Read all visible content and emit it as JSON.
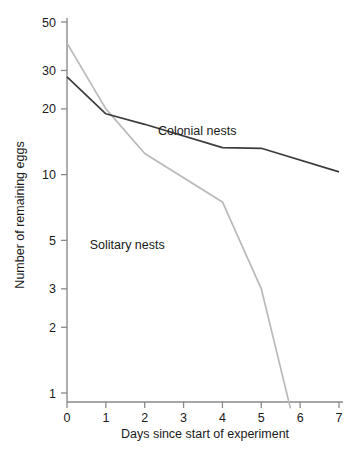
{
  "chart_data": {
    "type": "line",
    "title": "",
    "xlabel": "Days since start of experiment",
    "ylabel": "Number of remaining eggs",
    "yscale": "log",
    "ylim": [
      0.85,
      50
    ],
    "xlim": [
      0,
      7
    ],
    "grid": false,
    "legend_position": "inline-annotation",
    "yticks": [
      1,
      2,
      3,
      5,
      10,
      20,
      30,
      50
    ],
    "ytick_labels": [
      "1",
      "2",
      "3",
      "5",
      "10",
      "20",
      "30",
      "50"
    ],
    "xticks": [
      0,
      1,
      2,
      3,
      4,
      5,
      6,
      7
    ],
    "xtick_labels": [
      "0",
      "1",
      "2",
      "3",
      "4",
      "5",
      "6",
      "7"
    ],
    "series": [
      {
        "name": "Colonial nests",
        "color": "#3c3c3c",
        "x": [
          0,
          1,
          2,
          4,
          5,
          7
        ],
        "values": [
          28,
          19,
          17,
          13.3,
          13.2,
          10.3
        ]
      },
      {
        "name": "Solitary nests",
        "color": "#b9b9b9",
        "x": [
          0,
          1,
          2,
          4,
          5,
          5.75
        ],
        "values": [
          40,
          20,
          12.5,
          7.5,
          3,
          0.85
        ]
      }
    ],
    "annotations": [
      {
        "text": "Colonial nests",
        "x": 3.35,
        "y": 15.2
      },
      {
        "text": "Solitary nests",
        "x": 1.55,
        "y": 4.55
      }
    ]
  },
  "axis": {
    "y_title": "Number of remaining eggs",
    "x_title": "Days since start of experiment"
  }
}
